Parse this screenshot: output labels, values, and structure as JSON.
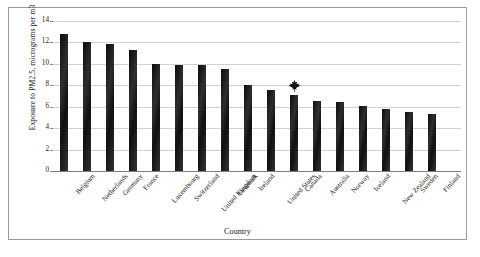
{
  "chart_data": {
    "type": "bar",
    "title": "",
    "xlabel": "Country",
    "ylabel": "Exposure to PM2.5, micrograms per m3",
    "ylim": [
      0,
      14
    ],
    "yticks": [
      0,
      2,
      4,
      6,
      8,
      10,
      12,
      14
    ],
    "grid": true,
    "legend": null,
    "categories": [
      "Belgium",
      "Netherlands",
      "Germany",
      "France",
      "Luxembourg",
      "Switzerland",
      "United Kingdom",
      "Denmark",
      "Ireland",
      "United States",
      "Canada",
      "Australia",
      "Norway",
      "Iceland",
      "New Zealand",
      "Sweden",
      "Finland"
    ],
    "values": [
      12.8,
      12.0,
      11.9,
      11.3,
      10.0,
      9.9,
      9.9,
      9.5,
      8.0,
      7.6,
      7.1,
      6.5,
      6.4,
      6.1,
      5.8,
      5.5,
      5.3
    ],
    "annotations": [
      {
        "icon": "maple-leaf-icon",
        "label": "Canada highlight",
        "category": "Canada",
        "color": "#111111"
      }
    ],
    "bar_color": "#1b1b1b"
  },
  "frame": {
    "border_color": "#9a9a9a"
  }
}
